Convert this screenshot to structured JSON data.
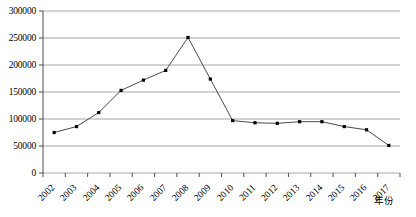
{
  "chart_data": {
    "type": "line",
    "title": "",
    "xlabel": "年份",
    "ylabel": "",
    "categories": [
      "2002",
      "2003",
      "2004",
      "2005",
      "2006",
      "2007",
      "2008",
      "2009",
      "2010",
      "2011",
      "2012",
      "2013",
      "2014",
      "2015",
      "2016",
      "2017"
    ],
    "values": [
      75000,
      86000,
      112000,
      153000,
      172000,
      190000,
      251000,
      174000,
      97000,
      93000,
      92000,
      95000,
      95000,
      86000,
      80000,
      51000
    ],
    "ylim": [
      0,
      300000
    ],
    "yticks": [
      "0",
      "50000",
      "100000",
      "150000",
      "200000",
      "250000",
      "300000"
    ],
    "ytick_values": [
      0,
      50000,
      100000,
      150000,
      200000,
      250000,
      300000
    ],
    "grid": true,
    "legend": false,
    "series_name": "",
    "marker": "filled-square",
    "line_color": "#4a4a4a",
    "marker_color": "#000000",
    "grid_color": "#a6a6a6",
    "axis_color": "#4d4d4d",
    "background_color": "#ffffff"
  }
}
